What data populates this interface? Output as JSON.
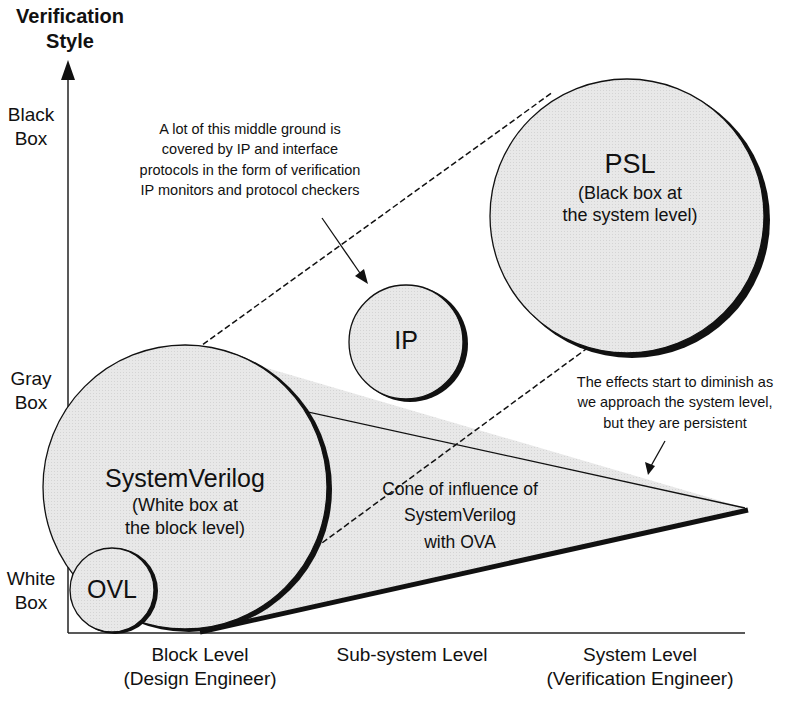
{
  "axes": {
    "y_title_line1": "Verification",
    "y_title_line2": "Style",
    "y_ticks": [
      {
        "line1": "Black",
        "line2": "Box"
      },
      {
        "line1": "Gray",
        "line2": "Box"
      },
      {
        "line1": "White",
        "line2": "Box"
      }
    ],
    "x_ticks": [
      {
        "line1": "Block Level",
        "line2": "(Design Engineer)"
      },
      {
        "line1": "Sub-system Level",
        "line2": ""
      },
      {
        "line1": "System Level",
        "line2": "(Verification Engineer)"
      }
    ]
  },
  "bubbles": {
    "ovl": {
      "title": "OVL"
    },
    "systemverilog": {
      "title": "SystemVerilog",
      "sub1": "(White box at",
      "sub2": "the block level)"
    },
    "ip": {
      "title": "IP"
    },
    "psl": {
      "title": "PSL",
      "sub1": "(Black box at",
      "sub2": "the system level)"
    }
  },
  "cone": {
    "line1": "Cone of influence of",
    "line2": "SystemVerilog",
    "line3": "with OVA"
  },
  "annotations": {
    "middle_ground": [
      "A lot of this middle ground is",
      "covered by IP and interface",
      "protocols in the form of verification",
      "IP monitors and protocol checkers"
    ],
    "effects": [
      "The effects start to diminish as",
      "we approach the system level,",
      "but they are persistent"
    ]
  },
  "colors": {
    "fill": "#e6e6e6",
    "stroke": "#111111"
  }
}
